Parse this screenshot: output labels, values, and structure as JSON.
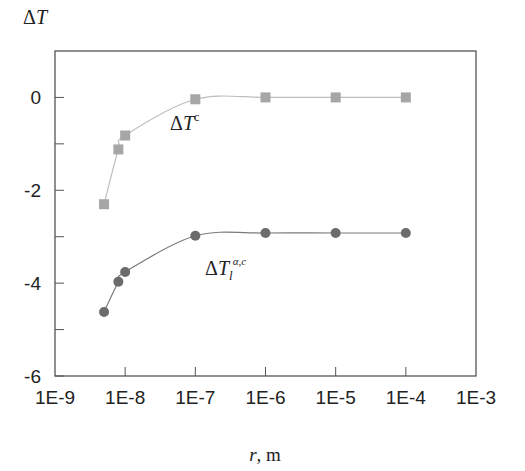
{
  "chart_data": {
    "type": "scatter",
    "title": "",
    "xlabel": "r, m",
    "ylabel": "ΔT",
    "xscale": "log",
    "xlim": [
      1e-09,
      0.001
    ],
    "ylim": [
      -6,
      1
    ],
    "x_tick_labels": [
      "1E-9",
      "1E-8",
      "1E-7",
      "1E-6",
      "1E-5",
      "1E-4",
      "1E-3"
    ],
    "y_tick_labels": [
      "0",
      "-2",
      "-4",
      "-6"
    ],
    "y_ticks": [
      0,
      -2,
      -4,
      -6
    ],
    "y_minor_ticks": [
      -1,
      -3,
      -5
    ],
    "grid": false,
    "legend": "inline annotations",
    "series": [
      {
        "name": "ΔT^c",
        "label_main": "ΔT",
        "label_sup": "c",
        "label_sub": "",
        "marker": "square",
        "color": "#a6a6a6",
        "line_color": "#bdbdbd",
        "x": [
          5e-09,
          8e-09,
          1e-08,
          1e-07,
          1e-06,
          1e-05,
          0.0001
        ],
        "values": [
          -2.3,
          -1.12,
          -0.82,
          -0.04,
          0,
          0,
          0
        ]
      },
      {
        "name": "ΔT_l^{α,c}",
        "label_main": "ΔT",
        "label_sup": "α,c",
        "label_sub": "l",
        "marker": "circle",
        "color": "#6b6b6b",
        "line_color": "#7a7a7a",
        "x": [
          5e-09,
          8e-09,
          1e-08,
          1e-07,
          1e-06,
          1e-05,
          0.0001
        ],
        "values": [
          -4.62,
          -3.97,
          -3.76,
          -2.98,
          -2.92,
          -2.92,
          -2.92
        ]
      }
    ]
  }
}
